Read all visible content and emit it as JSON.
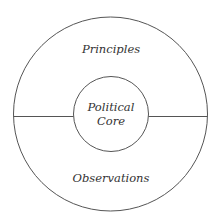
{
  "diagram": {
    "type": "concentric-circles",
    "outer_region": {
      "top_label": "Principles",
      "bottom_label": "Observations"
    },
    "inner_circle": {
      "line1": "Political",
      "line2": "Core"
    },
    "colors": {
      "stroke": "#555555",
      "text": "#333333",
      "background": "#ffffff"
    }
  }
}
